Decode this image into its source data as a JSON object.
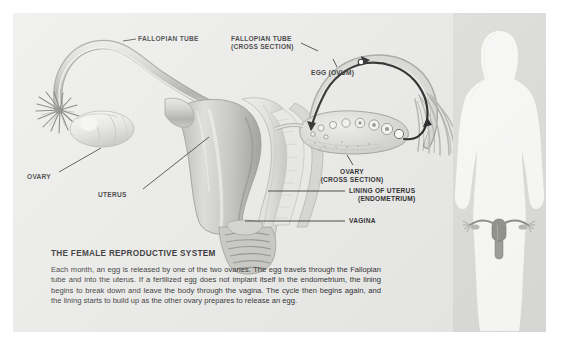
{
  "diagram": {
    "title": "THE FEMALE REPRODUCTIVE SYSTEM",
    "body": "Each month, an egg is released by one of the two ovaries. The egg travels through the Fallopian tube and into the uterus. If a fertilized egg does not implant itself in the endometrium, the lining begins to break down and leave the body through the vagina. The cycle then begins again, and the lining starts to build up as the other ovary prepares to release an egg.",
    "labels": {
      "fallopian_tube": "FALLOPIAN TUBE",
      "fallopian_tube_cross_1": "FALLOPIAN TUBE",
      "fallopian_tube_cross_2": "(CROSS SECTION)",
      "egg_ovum": "EGG (OVUM)",
      "ovary_left": "OVARY",
      "ovary_cross_1": "OVARY",
      "ovary_cross_2": "(CROSS SECTION)",
      "uterus": "UTERUS",
      "lining_1": "LINING OF UTERUS",
      "lining_2": "(ENDOMETRIUM)",
      "vagina": "VAGINA"
    },
    "icons": {
      "female_silhouette": "female-body-silhouette",
      "uterus_inset": "uterus-inset-icon",
      "egg_marker": "egg-dot-icon",
      "flow_arrows": "egg-travel-arrow-icon",
      "follicles": "ovarian-follicle-icon",
      "fimbriae": "fimbriae-fringe-icon"
    },
    "colors": {
      "panel_bg": "#e9e9e7",
      "figure_panel_bg": "#dcdcda",
      "silhouette": "#fbfbfa",
      "ink": "#121212",
      "organ_light": "#d7d7d3",
      "organ_mid": "#b2b2ad",
      "organ_dark": "#8d8d88"
    }
  }
}
